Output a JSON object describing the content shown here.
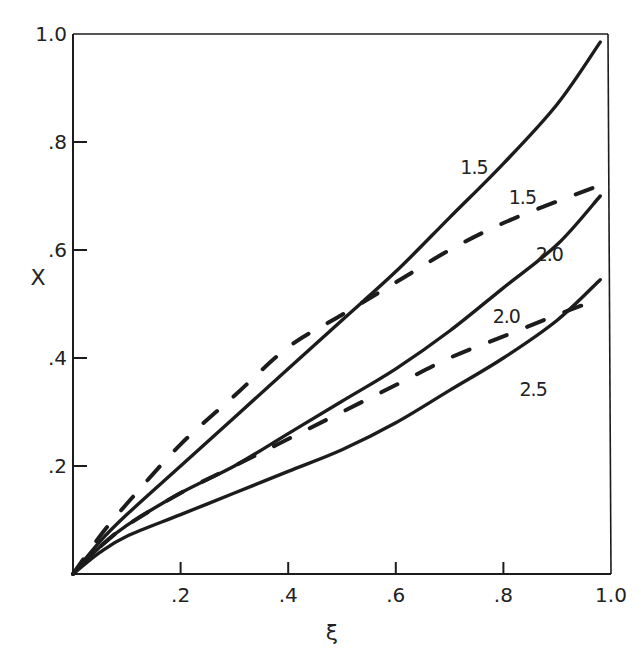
{
  "chart_data": {
    "type": "line",
    "title": "",
    "xlabel": "ξ",
    "ylabel": "X",
    "xlim": [
      0,
      1.0
    ],
    "ylim": [
      0,
      1.0
    ],
    "grid": false,
    "legend": "none (curves labeled inline)",
    "x_ticks": [
      ".2",
      ".4",
      ".6",
      ".8",
      "1.0"
    ],
    "x_tick_values": [
      0.2,
      0.4,
      0.6,
      0.8,
      1.0
    ],
    "y_ticks": [
      ".2",
      ".4",
      ".6",
      ".8",
      "1.0"
    ],
    "y_tick_values": [
      0.2,
      0.4,
      0.6,
      0.8,
      1.0
    ],
    "x": [
      0,
      0.05,
      0.1,
      0.2,
      0.3,
      0.4,
      0.5,
      0.6,
      0.7,
      0.8,
      0.9,
      0.98
    ],
    "series": [
      {
        "name": "1.5",
        "style": "solid",
        "values": [
          0,
          0.06,
          0.11,
          0.2,
          0.29,
          0.38,
          0.47,
          0.56,
          0.66,
          0.76,
          0.87,
          0.985
        ],
        "label_pos": [
          0.72,
          0.74
        ]
      },
      {
        "name": "1.5",
        "style": "dashed",
        "values": [
          0,
          0.07,
          0.13,
          0.24,
          0.33,
          0.42,
          0.48,
          0.54,
          0.6,
          0.65,
          0.69,
          0.72
        ],
        "label_pos": [
          0.81,
          0.685
        ]
      },
      {
        "name": "2.0",
        "style": "solid",
        "values": [
          0,
          0.05,
          0.09,
          0.15,
          0.2,
          0.26,
          0.32,
          0.38,
          0.45,
          0.53,
          0.61,
          0.7
        ],
        "label_pos": [
          0.86,
          0.58
        ]
      },
      {
        "name": "2.0",
        "style": "dashed",
        "values": [
          0,
          0.05,
          0.09,
          0.15,
          0.2,
          0.25,
          0.3,
          0.35,
          0.4,
          0.44,
          0.48,
          0.51
        ],
        "label_pos": [
          0.78,
          0.465
        ]
      },
      {
        "name": "2.5",
        "style": "solid",
        "values": [
          0,
          0.04,
          0.07,
          0.11,
          0.15,
          0.19,
          0.23,
          0.28,
          0.34,
          0.4,
          0.47,
          0.545
        ],
        "label_pos": [
          0.83,
          0.33
        ]
      }
    ]
  },
  "axes": {
    "xlabel": "ξ",
    "ylabel": "X"
  },
  "colors": {
    "ink": "#1c1c1c",
    "background": "#ffffff"
  }
}
